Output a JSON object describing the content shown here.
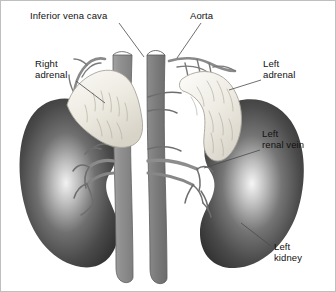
{
  "figure": {
    "background_color": "#ffffff",
    "border_color": "#bfbfbf",
    "width": 336,
    "height": 292
  },
  "labels": [
    {
      "id": "inferior-vena-cava",
      "text": "Inferior vena cava",
      "x": 29,
      "y": 9,
      "leader": {
        "x1": 118,
        "y1": 22,
        "x2": 143,
        "y2": 56
      }
    },
    {
      "id": "aorta",
      "text": "Aorta",
      "x": 189,
      "y": 9,
      "leader": {
        "x1": 200,
        "y1": 22,
        "x2": 176,
        "y2": 57
      }
    },
    {
      "id": "right-adrenal",
      "text": "Right\nadrenal",
      "x": 34,
      "y": 57,
      "leader": {
        "x1": 75,
        "y1": 80,
        "x2": 104,
        "y2": 102
      }
    },
    {
      "id": "left-adrenal",
      "text": "Left\nadrenal",
      "x": 262,
      "y": 57,
      "leader": {
        "x1": 260,
        "y1": 79,
        "x2": 228,
        "y2": 89
      }
    },
    {
      "id": "left-renal-vein",
      "text": "Left\nrenal vein",
      "x": 261,
      "y": 127,
      "leader": {
        "x1": 259,
        "y1": 149,
        "x2": 203,
        "y2": 167
      }
    },
    {
      "id": "left-kidney",
      "text": "Left\nkidney",
      "x": 273,
      "y": 240,
      "leader": {
        "x1": 270,
        "y1": 245,
        "x2": 240,
        "y2": 222
      }
    }
  ],
  "structures": {
    "inferior_vena_cava": {
      "name": "inferior vena cava",
      "color": "#8e8e8e"
    },
    "aorta": {
      "name": "aorta",
      "color": "#7b7b7b"
    },
    "right_kidney": {
      "name": "right kidney",
      "color": "#3d3d3d",
      "highlight": "#e8e8e8"
    },
    "left_kidney": {
      "name": "left kidney",
      "color": "#3d3d3d",
      "highlight": "#efefef"
    },
    "right_adrenal": {
      "name": "right adrenal gland",
      "color": "#f2f0ea"
    },
    "left_adrenal": {
      "name": "left adrenal gland",
      "color": "#f4f2ec"
    },
    "vessels": {
      "name": "renal vessels",
      "color": "#6f6f6f"
    }
  }
}
